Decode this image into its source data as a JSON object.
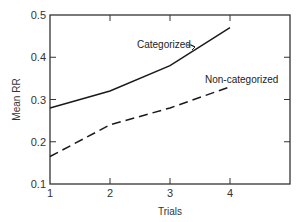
{
  "chart_data": {
    "type": "line",
    "title": "",
    "xlabel": "Trials",
    "ylabel": "Mean RR",
    "x": [
      1,
      2,
      3,
      4
    ],
    "xlim": [
      1,
      5
    ],
    "ylim": [
      0.1,
      0.5
    ],
    "xticks": [
      1,
      2,
      3,
      4
    ],
    "xtick_labels": [
      "1",
      "2",
      "3",
      "4"
    ],
    "yticks": [
      0.1,
      0.2,
      0.3,
      0.4,
      0.5
    ],
    "ytick_labels": [
      "0.1",
      "0.2",
      "0.3",
      "0.4",
      "0.5"
    ],
    "grid": false,
    "legend": "none (direct labels)",
    "series": [
      {
        "name": "Categorized",
        "style": "solid",
        "values": [
          0.28,
          0.32,
          0.38,
          0.47
        ]
      },
      {
        "name": "Non-categorized",
        "style": "dashed",
        "values": [
          0.165,
          0.24,
          0.28,
          0.33
        ]
      }
    ],
    "annotations": [
      {
        "text": "Categorized",
        "points_to_series": "Categorized",
        "arrow": true
      },
      {
        "text": "Non-categorized",
        "points_to_series": "Non-categorized",
        "arrow": false
      }
    ],
    "colors": {
      "line": "#1a1a1a",
      "axis": "#333333"
    }
  }
}
